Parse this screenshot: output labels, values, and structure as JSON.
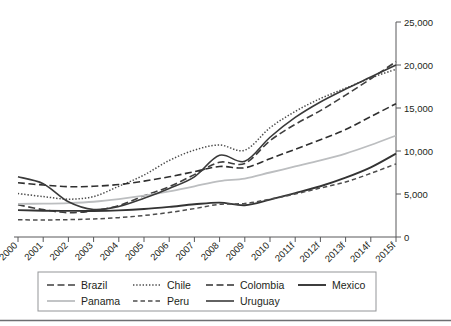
{
  "chart_data": {
    "type": "line",
    "title": "",
    "subtitle": "",
    "xlabel": "",
    "ylabel": "",
    "ylim": [
      0,
      25000
    ],
    "ytick_values": [
      0,
      5000,
      10000,
      15000,
      20000,
      25000
    ],
    "ytick_labels": [
      "0",
      "5,000",
      "10,000",
      "15,000",
      "20,000",
      "25,000"
    ],
    "y_axis_position": "right",
    "grid": false,
    "legend_position": "bottom",
    "x": [
      "2000",
      "2001",
      "2002",
      "2003",
      "2004",
      "2005",
      "2006",
      "2007",
      "2008",
      "2009",
      "2010",
      "2011f",
      "2012f",
      "2013f",
      "2014f",
      "2015f"
    ],
    "categories": [
      "2000",
      "2001",
      "2002",
      "2003",
      "2004",
      "2005",
      "2006",
      "2007",
      "2008",
      "2009",
      "2010",
      "2011f",
      "2012f",
      "2013f",
      "2014f",
      "2015f"
    ],
    "series": [
      {
        "name": "Brazil",
        "style": "dashed",
        "color": "#3f3f3f",
        "values": [
          3750,
          3180,
          2830,
          3050,
          3650,
          4800,
          5850,
          7250,
          8700,
          8550,
          11200,
          13100,
          14700,
          16500,
          18400,
          20400
        ]
      },
      {
        "name": "Chile",
        "style": "dotted",
        "color": "#4a4a4a",
        "values": [
          5050,
          4700,
          4400,
          4700,
          5900,
          7200,
          8900,
          10100,
          10700,
          10100,
          12700,
          14600,
          16100,
          17300,
          18500,
          19500
        ]
      },
      {
        "name": "Colombia",
        "style": "dashed",
        "color": "#2f2f2f",
        "values": [
          6300,
          6050,
          5850,
          5900,
          6100,
          6500,
          7000,
          7600,
          8200,
          8050,
          9100,
          10200,
          11300,
          12500,
          14000,
          15500
        ]
      },
      {
        "name": "Mexico",
        "style": "solid-bold",
        "color": "#333333",
        "values": [
          3120,
          3060,
          3040,
          3030,
          3100,
          3250,
          3500,
          3800,
          4000,
          3700,
          4350,
          5100,
          5900,
          6900,
          8100,
          9700
        ]
      },
      {
        "name": "Panama",
        "style": "solid-light",
        "color": "#bcbec0",
        "values": [
          3850,
          3880,
          3950,
          4100,
          4400,
          4800,
          5300,
          5900,
          6500,
          6800,
          7500,
          8200,
          8900,
          9700,
          10700,
          11800
        ]
      },
      {
        "name": "Peru",
        "style": "dashed-fine",
        "color": "#4d4d4d",
        "values": [
          2000,
          1980,
          2020,
          2100,
          2250,
          2500,
          2850,
          3300,
          3800,
          3900,
          4400,
          5000,
          5700,
          6400,
          7400,
          8500
        ]
      },
      {
        "name": "Uruguay",
        "style": "solid",
        "color": "#3a3a3a",
        "values": [
          7000,
          6200,
          4100,
          3200,
          3550,
          4500,
          5650,
          7000,
          9500,
          8800,
          11600,
          13900,
          15700,
          17200,
          18600,
          20000
        ]
      }
    ],
    "legend": [
      {
        "label": "Brazil",
        "style": "dashed"
      },
      {
        "label": "Chile",
        "style": "dotted"
      },
      {
        "label": "Colombia",
        "style": "dashed"
      },
      {
        "label": "Mexico",
        "style": "solid-bold"
      },
      {
        "label": "Panama",
        "style": "solid-light"
      },
      {
        "label": "Peru",
        "style": "dashed-fine"
      },
      {
        "label": "Uruguay",
        "style": "solid"
      }
    ]
  },
  "legend_rows": {
    "row1": [
      "Brazil",
      "Chile",
      "Colombia",
      "Mexico"
    ],
    "row2": [
      "Panama",
      "Peru",
      "Uruguay"
    ]
  }
}
